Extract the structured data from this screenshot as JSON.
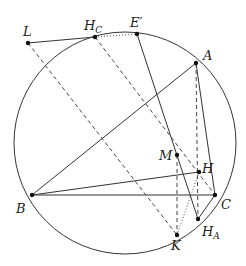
{
  "diagram": {
    "type": "geometry",
    "circle": {
      "cx": 125,
      "cy": 143,
      "r": 111
    },
    "points": {
      "L": {
        "x": 28,
        "y": 43,
        "label": "L",
        "sub": ""
      },
      "HC": {
        "x": 95,
        "y": 37,
        "label": "H",
        "sub": "C"
      },
      "Ep": {
        "x": 137,
        "y": 34,
        "label": "E′",
        "sub": ""
      },
      "A": {
        "x": 196,
        "y": 63,
        "label": "A",
        "sub": ""
      },
      "B": {
        "x": 32,
        "y": 195,
        "label": "B",
        "sub": ""
      },
      "C": {
        "x": 215,
        "y": 195,
        "label": "C",
        "sub": ""
      },
      "H": {
        "x": 199,
        "y": 172,
        "label": "H",
        "sub": ""
      },
      "M": {
        "x": 177,
        "y": 155,
        "label": "M",
        "sub": ""
      },
      "HA": {
        "x": 198,
        "y": 219,
        "label": "H",
        "sub": "A"
      },
      "K": {
        "x": 177,
        "y": 235,
        "label": "K",
        "sub": ""
      }
    },
    "labels": {
      "L": "L",
      "HC_main": "H",
      "HC_sub": "C",
      "Ep": "E′",
      "A": "A",
      "B": "B",
      "C": "C",
      "H": "H",
      "M": "M",
      "HA_main": "H",
      "HA_sub": "A",
      "K": "K"
    },
    "colors": {
      "stroke": "#333333",
      "point": "#111111",
      "background": "#ffffff"
    }
  }
}
